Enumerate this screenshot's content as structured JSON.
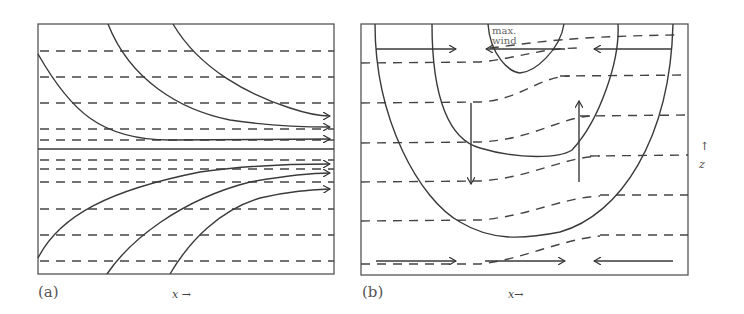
{
  "figure": {
    "panels": [
      {
        "id": "a",
        "label": "(a)",
        "x_axis_label": "x →",
        "description": "Horizontal dashed isentropes with solid streamlines (arrows pointing right) converging toward a central horizontal line"
      },
      {
        "id": "b",
        "label": "(b)",
        "x_axis_label": "x→",
        "z_axis_label": "z",
        "z_axis_arrow": "↑",
        "annotation": "max. wind",
        "annotation_lines": [
          "max.",
          "wind"
        ],
        "description": "Nested U-shaped solid isotachs around a wind maximum at the top, sloping dashed isentropes, downward arrow on left, upward arrow on right, opposing horizontal arrows at top and bottom"
      }
    ]
  }
}
